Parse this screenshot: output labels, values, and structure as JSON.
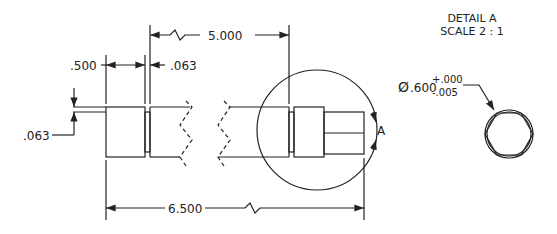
{
  "drawing": {
    "detail_title": "DETAIL A",
    "detail_scale": "SCALE 2 : 1",
    "detail_label": "A",
    "dimensions": {
      "overall_length": "6.500",
      "shaft_length": "5.000",
      "collar_width": ".500",
      "groove_width": ".063",
      "groove_depth": ".063",
      "diameter_symbol": "Ø",
      "diameter_value": ".600",
      "tol_upper": "+.000",
      "tol_lower": "-.005"
    },
    "colors": {
      "line": "#222222",
      "background": "#ffffff"
    }
  }
}
